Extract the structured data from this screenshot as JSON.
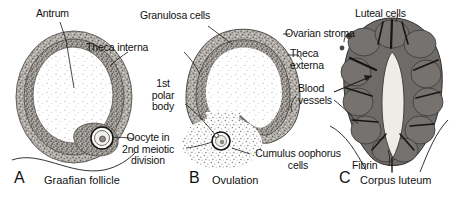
{
  "figure": {
    "background": "#ffffff",
    "ink": "#111111",
    "tissue_light": "#b4b0ab",
    "tissue_mid": "#8d8884",
    "tissue_dark": "#6b6764",
    "luteal_fill": "#6e6b68",
    "cavity": "#fdfdfc",
    "fibrin_fill": "#eceae4"
  },
  "panels": [
    {
      "id": "A",
      "letter": "A",
      "caption": "Graafian follicle",
      "letter_pos": {
        "x": 14,
        "y": 168
      },
      "caption_pos": {
        "x": 44,
        "y": 172
      },
      "labels": [
        {
          "name": "antrum",
          "text": "Antrum",
          "x": 36,
          "y": 10,
          "align": "left"
        },
        {
          "name": "theca-interna",
          "text": "Theca interna",
          "x": 86,
          "y": 44,
          "align": "left"
        }
      ]
    },
    {
      "id": "B",
      "letter": "B",
      "caption": "Ovulation",
      "letter_pos": {
        "x": 189,
        "y": 168
      },
      "caption_pos": {
        "x": 212,
        "y": 172
      },
      "labels": [
        {
          "name": "granulosa-cells",
          "text": "Granulosa cells",
          "x": 140,
          "y": 12,
          "align": "left"
        },
        {
          "name": "first-polar-body",
          "text": "1st\npolar\nbody",
          "x": 163,
          "y": 82,
          "align": "center"
        },
        {
          "name": "oocyte-second-meiotic-division",
          "text": "Oocyte in\n2nd meiotic\ndivision",
          "x": 140,
          "y": 136,
          "align": "center"
        },
        {
          "name": "cumulus-oophorus-cells",
          "text": "Cumulus oophorus\ncells",
          "x": 252,
          "y": 150,
          "align": "left"
        }
      ]
    },
    {
      "id": "C",
      "letter": "C",
      "caption": "Corpus luteum",
      "letter_pos": {
        "x": 339,
        "y": 168
      },
      "caption_pos": {
        "x": 360,
        "y": 172
      },
      "labels": [
        {
          "name": "luteal-cells",
          "text": "Luteal cells",
          "x": 355,
          "y": 10,
          "align": "left"
        },
        {
          "name": "ovarian-stroma",
          "text": "Ovarian stroma",
          "x": 286,
          "y": 30,
          "align": "left"
        },
        {
          "name": "theca-externa",
          "text": "Theca\nexterna",
          "x": 290,
          "y": 50,
          "align": "left"
        },
        {
          "name": "blood-vessels",
          "text": "Blood\nvessels",
          "x": 299,
          "y": 85,
          "align": "left"
        },
        {
          "name": "fibrin",
          "text": "Fibrin",
          "x": 352,
          "y": 152,
          "align": "left"
        }
      ]
    }
  ]
}
